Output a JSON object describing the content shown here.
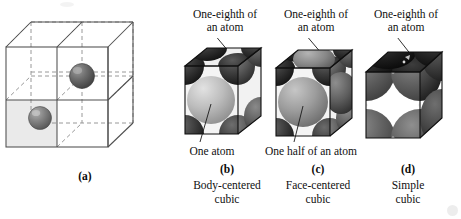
{
  "figure": {
    "background_color": "#ffffff",
    "text_color": "#101010"
  },
  "panels": [
    {
      "letter": "(a)",
      "kind": "lattice-line-drawing",
      "caption_lines": [],
      "callouts": [],
      "description": "Wireframe array of eight cubic cells with two shaded atoms",
      "atoms": 2,
      "shaded_face": true
    },
    {
      "letter": "(b)",
      "kind": "body-centered-cubic",
      "caption_lines": [
        "Body-centered",
        "cubic"
      ],
      "callouts": [
        {
          "id": "top",
          "lines": [
            "One-eighth of",
            "an atom"
          ]
        },
        {
          "id": "bottom",
          "lines": [
            "One atom"
          ]
        }
      ]
    },
    {
      "letter": "(c)",
      "kind": "face-centered-cubic",
      "caption_lines": [
        "Face-centered",
        "cubic"
      ],
      "callouts": [
        {
          "id": "top",
          "lines": [
            "One-eighth of",
            "an atom"
          ]
        },
        {
          "id": "bottom",
          "lines": [
            "One half of an atom"
          ]
        }
      ]
    },
    {
      "letter": "(d)",
      "kind": "simple-cubic",
      "caption_lines": [
        "Simple",
        "cubic"
      ],
      "callouts": [
        {
          "id": "top",
          "lines": [
            "One-eighth of",
            "an atom"
          ]
        }
      ]
    }
  ],
  "labels": {
    "b_top_line1": "One-eighth of",
    "b_top_line2": "an atom",
    "c_top_line1": "One-eighth of",
    "c_top_line2": "an atom",
    "d_top_line1": "One-eighth of",
    "d_top_line2": "an atom",
    "b_bottom": "One atom",
    "c_bottom": "One half of an atom",
    "a_letter": "(a)",
    "b_letter": "(b)",
    "c_letter": "(c)",
    "d_letter": "(d)",
    "b_caption1": "Body-centered",
    "b_caption2": "cubic",
    "c_caption1": "Face-centered",
    "c_caption2": "cubic",
    "d_caption1": "Simple",
    "d_caption2": "cubic"
  },
  "colors": {
    "line": "#4a4a4a",
    "dashed_line": "#8a8a8a",
    "shaded_face": "#e6e6e6",
    "atom_dark": "#5a5a5a",
    "atom_mid": "#7e7e7e",
    "cube_dark": "#2a2a2a",
    "cube_mid": "#565656",
    "cube_light": "#8e8e8e",
    "sphere_light": "#c9c9c9"
  }
}
